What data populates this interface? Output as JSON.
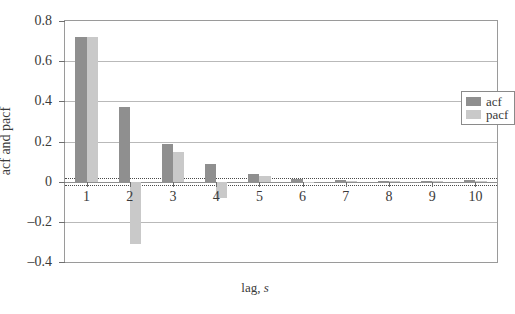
{
  "chart_data": {
    "type": "bar",
    "title": "",
    "subtitle": "",
    "xlabel": "lag, s",
    "xlabel_main": "lag,",
    "xlabel_symbol": "s",
    "ylabel": "acf and pacf",
    "categories": [
      "1",
      "2",
      "3",
      "4",
      "5",
      "6",
      "7",
      "8",
      "9",
      "10"
    ],
    "series": [
      {
        "name": "acf",
        "color": "#8f8f8f",
        "values": [
          0.72,
          0.37,
          0.19,
          0.09,
          0.04,
          0.015,
          0.008,
          0.005,
          0.004,
          0.006
        ]
      },
      {
        "name": "pacf",
        "color": "#c9c9c9",
        "values": [
          0.72,
          -0.31,
          0.15,
          -0.08,
          0.03,
          -0.005,
          0.005,
          0.002,
          0.003,
          0.004
        ]
      }
    ],
    "ylim": [
      -0.4,
      0.8
    ],
    "yticks": [
      0.8,
      0.6,
      0.4,
      0.2,
      0,
      -0.2,
      -0.4
    ],
    "ytick_labels": [
      "0.8",
      "0.6",
      "0.4",
      "0.2",
      "0",
      "–0.2",
      "–0.4"
    ],
    "grid": true,
    "grid_axis": "y",
    "legend_position": "top-right",
    "confidence_bands": [
      0.018,
      -0.018
    ],
    "confidence_band_style": "dotted"
  },
  "legend": {
    "entries": [
      {
        "label": "acf",
        "color": "#8f8f8f"
      },
      {
        "label": "pacf",
        "color": "#c9c9c9"
      }
    ]
  }
}
